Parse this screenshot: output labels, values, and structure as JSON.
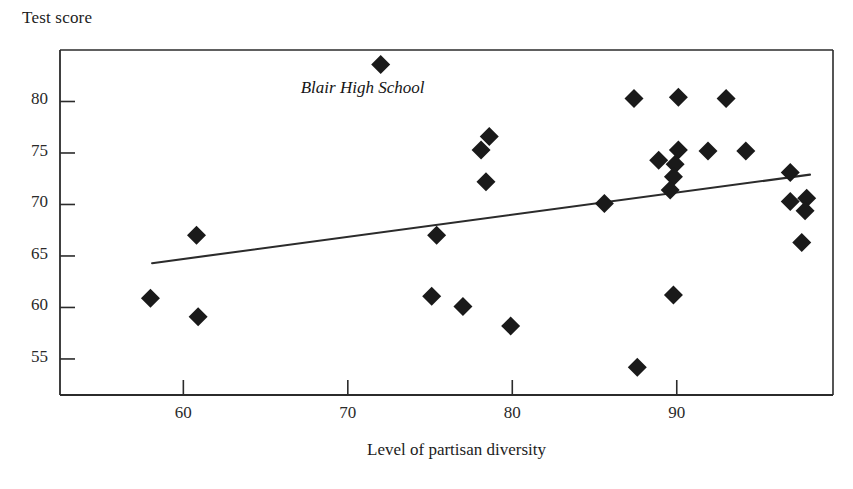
{
  "chart_data": {
    "type": "scatter",
    "title": "",
    "xlabel": "Level of partisan diversity",
    "ylabel": "Test score",
    "xlim": [
      52.5,
      99.5
    ],
    "ylim": [
      51.5,
      85.0
    ],
    "xticks": [
      60,
      70,
      80,
      90
    ],
    "yticks": [
      55,
      60,
      65,
      70,
      75,
      80
    ],
    "grid": false,
    "legend": null,
    "marker": "diamond",
    "marker_color": "#1a1a1a",
    "points": [
      {
        "x": 58.0,
        "y": 60.9
      },
      {
        "x": 60.8,
        "y": 67.0
      },
      {
        "x": 60.9,
        "y": 59.1
      },
      {
        "x": 72.0,
        "y": 83.6,
        "label": "Blair High School"
      },
      {
        "x": 75.1,
        "y": 61.1
      },
      {
        "x": 75.4,
        "y": 67.0
      },
      {
        "x": 77.0,
        "y": 60.1
      },
      {
        "x": 78.1,
        "y": 75.3
      },
      {
        "x": 78.6,
        "y": 76.6
      },
      {
        "x": 78.4,
        "y": 72.2
      },
      {
        "x": 79.9,
        "y": 58.2
      },
      {
        "x": 85.6,
        "y": 70.1
      },
      {
        "x": 87.4,
        "y": 80.3
      },
      {
        "x": 87.6,
        "y": 54.2
      },
      {
        "x": 88.9,
        "y": 74.3
      },
      {
        "x": 90.1,
        "y": 80.4
      },
      {
        "x": 90.1,
        "y": 75.3
      },
      {
        "x": 89.9,
        "y": 73.9
      },
      {
        "x": 89.8,
        "y": 72.7
      },
      {
        "x": 89.6,
        "y": 71.4
      },
      {
        "x": 89.8,
        "y": 61.2
      },
      {
        "x": 91.9,
        "y": 75.2
      },
      {
        "x": 93.0,
        "y": 80.3
      },
      {
        "x": 94.2,
        "y": 75.2
      },
      {
        "x": 96.9,
        "y": 73.1
      },
      {
        "x": 96.9,
        "y": 70.3
      },
      {
        "x": 97.9,
        "y": 70.6
      },
      {
        "x": 97.8,
        "y": 69.4
      },
      {
        "x": 97.6,
        "y": 66.3
      }
    ],
    "trendline": {
      "x0": 58.1,
      "y0": 64.3,
      "x1": 98.1,
      "y1": 72.9
    }
  },
  "annotation": {
    "text": "Blair High School"
  },
  "axes": {
    "y_title": "Test score",
    "x_title": "Level of partisan diversity",
    "y_tick_labels": [
      "80",
      "75",
      "70",
      "65",
      "60",
      "55"
    ],
    "x_tick_labels": [
      "60",
      "70",
      "80",
      "90"
    ]
  },
  "style": {
    "frame_color": "#2b2b2b",
    "marker_color": "#1a1a1a",
    "line_color": "#2b2b2b",
    "background": "#ffffff"
  }
}
